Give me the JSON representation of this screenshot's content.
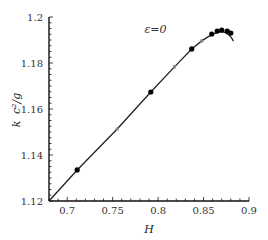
{
  "chart_data": {
    "type": "line",
    "title": "",
    "xlabel": "H",
    "ylabel": "k c^2/g",
    "xlim": [
      0.68,
      0.9
    ],
    "ylim": [
      1.12,
      1.2
    ],
    "grid": false,
    "legend": null,
    "xticks": [
      0.7,
      0.75,
      0.8,
      0.85,
      0.9
    ],
    "xtick_labels": [
      "0.7",
      "0.75",
      "0.8",
      "0.85",
      "0.9"
    ],
    "yticks": [
      1.12,
      1.14,
      1.16,
      1.18,
      1.2
    ],
    "ytick_labels": [
      "1.12",
      "1.14",
      "1.16",
      "1.18",
      "1.2"
    ],
    "annotations": [
      {
        "text": "ε=0",
        "x": 0.785,
        "y": 1.193
      }
    ],
    "series": [
      {
        "name": "curve",
        "style": "solid line",
        "color": "#222222",
        "x": [
          0.68,
          0.711,
          0.755,
          0.792,
          0.818,
          0.837,
          0.848,
          0.859,
          0.865,
          0.87,
          0.874,
          0.878,
          0.881,
          0.883
        ],
        "y": [
          1.12,
          1.1335,
          1.1513,
          1.1674,
          1.1783,
          1.1861,
          1.1896,
          1.1923,
          1.1933,
          1.1936,
          1.1932,
          1.1922,
          1.1908,
          1.1895
        ]
      },
      {
        "name": "black markers",
        "style": "filled circle",
        "color": "#000000",
        "x": [
          0.711,
          0.792,
          0.837,
          0.859,
          0.865,
          0.87,
          0.876,
          0.88
        ],
        "y": [
          1.1335,
          1.1674,
          1.1861,
          1.1926,
          1.1939,
          1.1943,
          1.1939,
          1.193
        ]
      },
      {
        "name": "gray markers",
        "style": "small gray circle",
        "color": "#888888",
        "x": [
          0.755,
          0.818,
          0.848
        ],
        "y": [
          1.1513,
          1.1783,
          1.1896
        ]
      }
    ]
  },
  "labels": {
    "xlabel": "H",
    "ylabel_k": "k",
    "ylabel_rest": "c²/g",
    "annotation": "ε=0"
  }
}
